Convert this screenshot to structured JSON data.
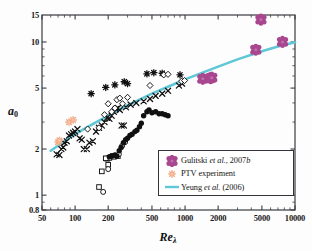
{
  "chart_data": {
    "type": "scatter",
    "title": "",
    "xlabel": "Re_lambda",
    "xlabel_text": "Re",
    "xlabel_sub": "λ",
    "ylabel_text": "a",
    "ylabel_sub": "0",
    "xscale": "log",
    "yscale": "log",
    "xlim": [
      50,
      10000
    ],
    "ylim": [
      0.8,
      15
    ],
    "grid": false,
    "xticks": [
      50,
      100,
      200,
      500,
      1000,
      2000,
      5000,
      10000
    ],
    "xtick_labels": [
      "50",
      "100",
      "200",
      "500",
      "1000",
      "2000",
      "5000",
      "10000"
    ],
    "yticks": [
      0.8,
      1,
      2,
      5,
      10,
      15
    ],
    "ytick_labels": [
      "0.8",
      "1",
      "2",
      "5",
      "10",
      "15"
    ],
    "legend_position": "lower-right-inside",
    "colors": {
      "gulitski": "#a8478f",
      "ptv": "#f4b393",
      "yeung_line": "#5fc7d6",
      "black_markers": "#101010",
      "axis": "#3a3b40"
    },
    "series": [
      {
        "name": "Gulitski et al., 2007b",
        "marker": "filled-cluster-flower",
        "color": "#a8478f",
        "points": [
          [
            1450,
            5.75
          ],
          [
            1700,
            5.8
          ],
          [
            1750,
            5.85
          ],
          [
            4400,
            8.9
          ],
          [
            4900,
            14.0
          ],
          [
            7700,
            10.0
          ]
        ]
      },
      {
        "name": "PTV experiment",
        "marker": "small-star",
        "color": "#f4b393",
        "points": [
          [
            70,
            2.22
          ],
          [
            72,
            2.28
          ],
          [
            88,
            3.0
          ],
          [
            96,
            3.1
          ]
        ]
      },
      {
        "name": "Yeung et al. (2006)",
        "marker": "line",
        "color": "#5fc7d6",
        "points": [
          [
            60,
            1.95
          ],
          [
            80,
            2.25
          ],
          [
            100,
            2.5
          ],
          [
            150,
            2.95
          ],
          [
            200,
            3.3
          ],
          [
            300,
            3.85
          ],
          [
            500,
            4.6
          ],
          [
            700,
            5.1
          ],
          [
            1000,
            5.7
          ],
          [
            2000,
            6.9
          ],
          [
            3000,
            7.7
          ],
          [
            5000,
            8.7
          ],
          [
            7000,
            9.35
          ],
          [
            10000,
            9.95
          ]
        ]
      },
      {
        "name": "DNS filled circles",
        "marker": "filled-circle",
        "color": "#101010",
        "points": [
          [
            205,
            1.78
          ],
          [
            215,
            1.8
          ],
          [
            228,
            1.82
          ],
          [
            240,
            1.8
          ],
          [
            252,
            1.95
          ],
          [
            262,
            2.05
          ],
          [
            275,
            2.2
          ],
          [
            288,
            2.3
          ],
          [
            300,
            2.35
          ],
          [
            315,
            2.45
          ],
          [
            330,
            2.5
          ],
          [
            350,
            2.6
          ],
          [
            365,
            2.65
          ],
          [
            385,
            2.8
          ],
          [
            400,
            2.95
          ],
          [
            420,
            3.3
          ],
          [
            450,
            3.5
          ],
          [
            470,
            3.6
          ],
          [
            500,
            3.45
          ],
          [
            540,
            3.5
          ],
          [
            580,
            3.4
          ],
          [
            620,
            3.4
          ],
          [
            660,
            3.35
          ],
          [
            700,
            3.3
          ]
        ]
      },
      {
        "name": "DNS crosses",
        "marker": "cross",
        "color": "#101010",
        "points": [
          [
            68,
            1.85
          ],
          [
            72,
            1.83
          ],
          [
            75,
            2.0
          ],
          [
            78,
            2.05
          ],
          [
            80,
            2.2
          ],
          [
            84,
            2.25
          ],
          [
            88,
            2.45
          ],
          [
            92,
            2.5
          ],
          [
            96,
            2.55
          ],
          [
            100,
            2.6
          ],
          [
            105,
            2.7
          ],
          [
            110,
            2.35
          ],
          [
            115,
            2.3
          ],
          [
            120,
            2.0
          ],
          [
            128,
            2.0
          ],
          [
            135,
            2.2
          ],
          [
            145,
            2.25
          ],
          [
            155,
            2.6
          ],
          [
            165,
            2.75
          ],
          [
            175,
            2.85
          ],
          [
            185,
            3.0
          ],
          [
            195,
            3.2
          ],
          [
            205,
            3.15
          ],
          [
            215,
            3.3
          ],
          [
            225,
            3.5
          ],
          [
            235,
            3.65
          ],
          [
            245,
            3.7
          ],
          [
            255,
            3.6
          ],
          [
            265,
            2.85
          ],
          [
            278,
            2.85
          ],
          [
            290,
            3.75
          ],
          [
            320,
            3.9
          ],
          [
            360,
            4.0
          ],
          [
            420,
            4.1
          ],
          [
            480,
            4.25
          ],
          [
            540,
            4.45
          ],
          [
            620,
            4.6
          ],
          [
            700,
            4.8
          ],
          [
            880,
            5.2
          ],
          [
            940,
            5.35
          ]
        ]
      },
      {
        "name": "DNS open diamonds",
        "marker": "open-diamond",
        "color": "#101010",
        "points": [
          [
            130,
            2.7
          ],
          [
            165,
            2.75
          ],
          [
            185,
            3.35
          ],
          [
            200,
            3.95
          ],
          [
            215,
            3.5
          ],
          [
            230,
            3.7
          ],
          [
            240,
            4.2
          ],
          [
            255,
            4.3
          ],
          [
            270,
            3.95
          ],
          [
            300,
            4.35
          ],
          [
            480,
            5.2
          ],
          [
            640,
            6.1
          ],
          [
            700,
            6.15
          ],
          [
            930,
            5.55
          ],
          [
            990,
            5.6
          ]
        ]
      },
      {
        "name": "DNS stars",
        "marker": "star-burst",
        "color": "#101010",
        "points": [
          [
            140,
            4.6
          ],
          [
            190,
            5.05
          ],
          [
            230,
            5.25
          ],
          [
            280,
            5.5
          ],
          [
            300,
            5.35
          ],
          [
            450,
            6.2
          ],
          [
            520,
            6.3
          ],
          [
            620,
            6.25
          ],
          [
            900,
            6.1
          ]
        ]
      },
      {
        "name": "DNS open squares",
        "marker": "open-square",
        "color": "#101010",
        "points": [
          [
            165,
            1.13
          ],
          [
            175,
            1.43
          ],
          [
            196,
            1.73
          ],
          [
            205,
            1.75
          ],
          [
            200,
            1.58
          ],
          [
            225,
            1.78
          ],
          [
            245,
            1.8
          ],
          [
            190,
            1.74
          ]
        ]
      },
      {
        "name": "DNS open circles",
        "marker": "open-circle",
        "color": "#101010",
        "points": [
          [
            180,
            1.05
          ],
          [
            200,
            1.48
          ],
          [
            215,
            1.8
          ],
          [
            232,
            1.82
          ],
          [
            250,
            1.85
          ],
          [
            268,
            2.1
          ],
          [
            285,
            2.22
          ]
        ]
      }
    ]
  },
  "legend": {
    "entries": [
      {
        "label_html": "Gulitski <i>et al.</i>, 2007<i>b</i>",
        "symbol": "gulitski-marker"
      },
      {
        "label_html": "PTV experiment",
        "symbol": "ptv-marker"
      },
      {
        "label_html": "Yeung <i>et al.</i> (2006)",
        "symbol": "yeung-line"
      }
    ]
  }
}
